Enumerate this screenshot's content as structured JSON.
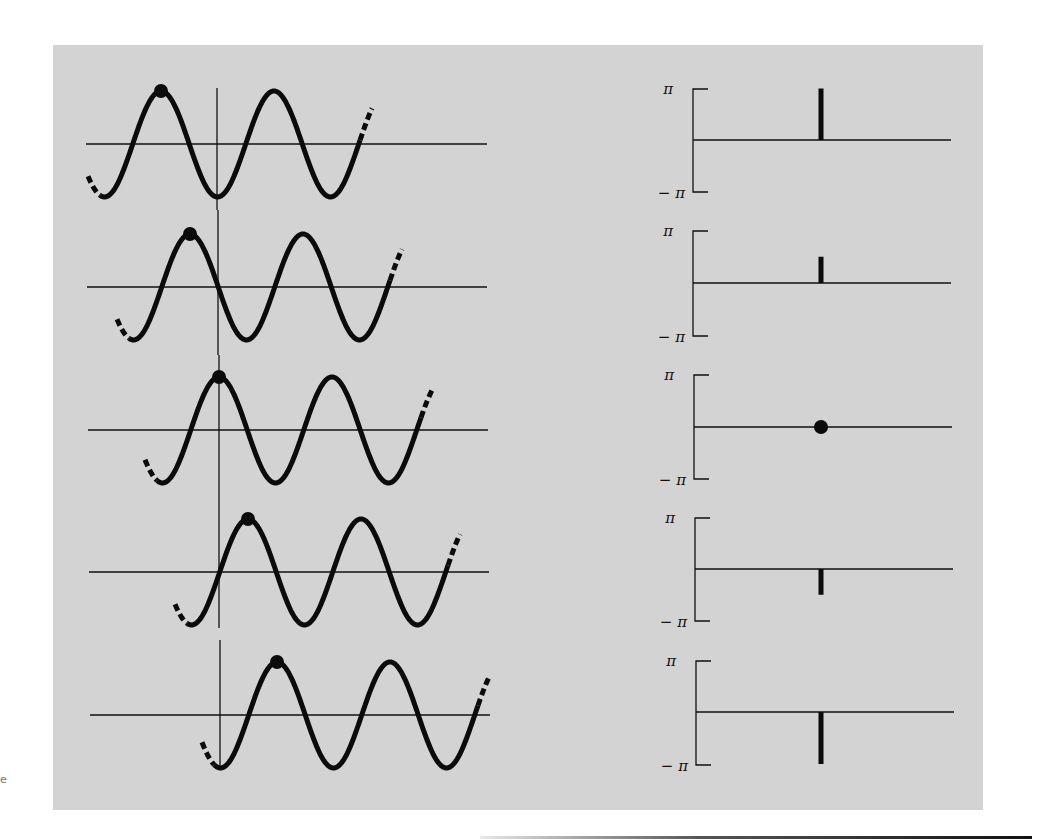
{
  "figure": {
    "background_color": "#d3d3d3",
    "ink_color": "#0b0b0b",
    "phase_axis_labels": {
      "top": "π",
      "bottom": "− π"
    },
    "stray_mark": "e"
  },
  "chart_data": {
    "type": "diagram",
    "title": "",
    "panels": [
      {
        "row": 1,
        "wave": {
          "amplitude": 1,
          "phase_label": "π",
          "peak_offset_fraction_of_period": -0.5
        },
        "phase": {
          "value": 3.1416,
          "label": "π",
          "marker": "bar-up"
        }
      },
      {
        "row": 2,
        "wave": {
          "amplitude": 1,
          "phase_label": "π/2",
          "peak_offset_fraction_of_period": -0.25
        },
        "phase": {
          "value": 1.5708,
          "label": "π/2",
          "marker": "bar-up"
        }
      },
      {
        "row": 3,
        "wave": {
          "amplitude": 1,
          "phase_label": "0",
          "peak_offset_fraction_of_period": 0
        },
        "phase": {
          "value": 0,
          "label": "0",
          "marker": "dot"
        }
      },
      {
        "row": 4,
        "wave": {
          "amplitude": 1,
          "phase_label": "-π/2",
          "peak_offset_fraction_of_period": 0.25
        },
        "phase": {
          "value": -1.5708,
          "label": "-π/2",
          "marker": "bar-down"
        }
      },
      {
        "row": 5,
        "wave": {
          "amplitude": 1,
          "phase_label": "-π",
          "peak_offset_fraction_of_period": 0.5
        },
        "phase": {
          "value": -3.1416,
          "label": "-π",
          "marker": "bar-down"
        }
      }
    ],
    "phase_axis": {
      "ylim": [
        -3.1416,
        3.1416
      ],
      "tick_labels": [
        "π",
        "−π"
      ]
    }
  },
  "layout_rows": [
    {
      "axisX": 217,
      "axisY": 144,
      "peakX": 161,
      "startX": 88,
      "endX": 372,
      "hLeft": 86,
      "hRight": 487,
      "vTop": 88,
      "vBot": 210
    },
    {
      "axisX": 218,
      "axisY": 287,
      "peakX": 190,
      "startX": 117,
      "endX": 402,
      "hLeft": 87,
      "hRight": 487,
      "vTop": 210,
      "vBot": 355
    },
    {
      "axisX": 219,
      "axisY": 430,
      "peakX": 219,
      "startX": 145,
      "endX": 433,
      "hLeft": 88,
      "hRight": 488,
      "vTop": 355,
      "vBot": 497
    },
    {
      "axisX": 219,
      "axisY": 572,
      "peakX": 248,
      "startX": 175,
      "endX": 460,
      "hLeft": 89,
      "hRight": 489,
      "vTop": 497,
      "vBot": 628
    },
    {
      "axisX": 220,
      "axisY": 715,
      "peakX": 277,
      "startX": 202,
      "endX": 490,
      "hLeft": 90,
      "hRight": 490,
      "vTop": 640,
      "vBot": 770
    }
  ],
  "phase_rows": [
    {
      "bx": 693,
      "top": 89,
      "mid": 140,
      "bot": 192,
      "right": 951
    },
    {
      "bx": 693,
      "top": 231,
      "mid": 283,
      "bot": 336,
      "right": 951
    },
    {
      "bx": 694,
      "top": 375,
      "mid": 427,
      "bot": 479,
      "right": 952
    },
    {
      "bx": 695,
      "top": 518,
      "mid": 569,
      "bot": 621,
      "right": 953
    },
    {
      "bx": 696,
      "top": 661,
      "mid": 712,
      "bot": 765,
      "right": 954
    }
  ],
  "wave_params": {
    "amplitude_px": 53,
    "period_px": 113
  },
  "stem_x": 821
}
